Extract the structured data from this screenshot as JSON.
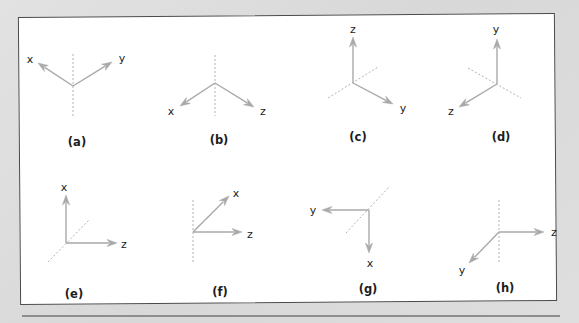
{
  "figure": {
    "panels": [
      {
        "id": "a",
        "caption": "(a)",
        "origin": [
          73,
          86
        ],
        "axes": [
          {
            "label": "x",
            "end": [
              38,
              63
            ],
            "label_pos": [
              30,
              63
            ]
          },
          {
            "label": "y",
            "end": [
              112,
              62
            ],
            "label_pos": [
              122,
              62
            ]
          }
        ],
        "dashed": [
          [
            73,
            54
          ],
          [
            73,
            116
          ]
        ],
        "caption_pos": [
          77,
          146
        ]
      },
      {
        "id": "b",
        "caption": "(b)",
        "origin": [
          215,
          83
        ],
        "axes": [
          {
            "label": "x",
            "end": [
              180,
              106
            ],
            "label_pos": [
              171,
              115
            ]
          },
          {
            "label": "z",
            "end": [
              254,
              107
            ],
            "label_pos": [
              263,
              115
            ]
          }
        ],
        "dashed": [
          [
            215,
            55
          ],
          [
            215,
            116
          ]
        ],
        "caption_pos": [
          219,
          144
        ]
      },
      {
        "id": "c",
        "caption": "(c)",
        "origin": [
          353,
          83
        ],
        "axes": [
          {
            "label": "z",
            "end": [
              353,
              37
            ],
            "label_pos": [
              353,
              33
            ]
          },
          {
            "label": "y",
            "end": [
              393,
              104
            ],
            "label_pos": [
              403,
              112
            ]
          }
        ],
        "dashed": [
          [
            328,
            98
          ],
          [
            378,
            67
          ]
        ],
        "caption_pos": [
          358,
          141
        ]
      },
      {
        "id": "d",
        "caption": "(d)",
        "origin": [
          497,
          84
        ],
        "axes": [
          {
            "label": "y",
            "end": [
              497,
              39
            ],
            "label_pos": [
              496,
              33
            ]
          },
          {
            "label": "z",
            "end": [
              459,
              107
            ],
            "label_pos": [
              451,
              115
            ]
          }
        ],
        "dashed": [
          [
            468,
            68
          ],
          [
            521,
            98
          ]
        ],
        "caption_pos": [
          501,
          141
        ]
      },
      {
        "id": "e",
        "caption": "(e)",
        "origin": [
          66,
          243
        ],
        "axes": [
          {
            "label": "x",
            "end": [
              66,
              195
            ],
            "label_pos": [
              64,
              191
            ]
          },
          {
            "label": "z",
            "end": [
              117,
              243
            ],
            "label_pos": [
              124,
              248
            ]
          }
        ],
        "dashed": [
          [
            48,
            262
          ],
          [
            89,
            220
          ]
        ],
        "caption_pos": [
          74,
          298
        ]
      },
      {
        "id": "f",
        "caption": "(f)",
        "origin": [
          193,
          232
        ],
        "axes": [
          {
            "label": "x",
            "end": [
              229,
              196
            ],
            "label_pos": [
              236,
              197
            ]
          },
          {
            "label": "z",
            "end": [
              242,
              232
            ],
            "label_pos": [
              250,
              238
            ]
          }
        ],
        "dashed": [
          [
            193,
            200
          ],
          [
            193,
            264
          ]
        ],
        "caption_pos": [
          220,
          296
        ]
      },
      {
        "id": "g",
        "caption": "(g)",
        "origin": [
          369,
          210
        ],
        "axes": [
          {
            "label": "y",
            "end": [
              322,
              210
            ],
            "label_pos": [
              313,
              214
            ]
          },
          {
            "label": "x",
            "end": [
              369,
              253
            ],
            "label_pos": [
              370,
              267
            ]
          }
        ],
        "dashed": [
          [
            346,
            233
          ],
          [
            390,
            186
          ]
        ],
        "caption_pos": [
          368,
          293
        ]
      },
      {
        "id": "h",
        "caption": "(h)",
        "origin": [
          499,
          232
        ],
        "axes": [
          {
            "label": "z",
            "end": [
              544,
              232
            ],
            "label_pos": [
              554,
              236
            ]
          },
          {
            "label": "y",
            "end": [
              469,
              263
            ],
            "label_pos": [
              462,
              274
            ]
          }
        ],
        "dashed": [
          [
            499,
            200
          ],
          [
            499,
            262
          ]
        ],
        "caption_pos": [
          505,
          292
        ]
      }
    ]
  },
  "colors": {
    "background": "#dcdcdc",
    "panel": "#ffffff",
    "panel_border": "#4a4a4a",
    "axis": "#a9a9a9",
    "dashed": "#b3b3b3",
    "text": "#1c1c1c",
    "separator": "#8e8e8e"
  }
}
